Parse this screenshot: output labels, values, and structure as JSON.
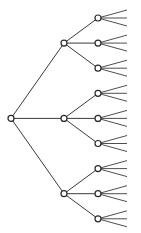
{
  "diagram": {
    "type": "tree",
    "orientation": "left-to-right",
    "root": {
      "id": "root",
      "children": [
        {
          "id": "a",
          "children": [
            {
              "id": "a1",
              "leaves": 3
            },
            {
              "id": "a2",
              "leaves": 3
            },
            {
              "id": "a3",
              "leaves": 3
            }
          ]
        },
        {
          "id": "b",
          "children": [
            {
              "id": "b1",
              "leaves": 3
            },
            {
              "id": "b2",
              "leaves": 3
            },
            {
              "id": "b3",
              "leaves": 3
            }
          ]
        },
        {
          "id": "c",
          "children": [
            {
              "id": "c1",
              "leaves": 3
            },
            {
              "id": "c2",
              "leaves": 3
            },
            {
              "id": "c3",
              "leaves": 3
            }
          ]
        }
      ]
    },
    "colors": {
      "line": "#3a3a3a",
      "node_fill": "#ffffff",
      "node_stroke": "#2a2a2a"
    }
  }
}
